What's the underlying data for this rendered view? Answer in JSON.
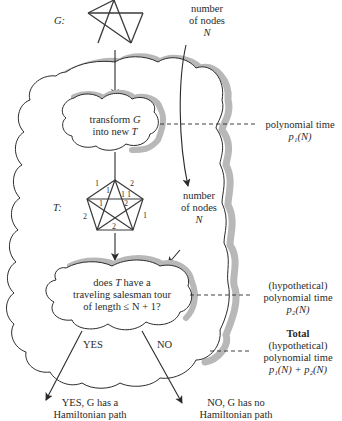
{
  "graph_g": {
    "label": "G:",
    "nodes_label_line1": "number",
    "nodes_label_line2": "of nodes",
    "nodes_label_var": "N"
  },
  "transform_step": {
    "line1_text": "transform ",
    "line1_var": "G",
    "line2_text": "into new ",
    "line2_var": "T"
  },
  "time1": {
    "line1": "polynomial time",
    "line2": "p₁(N)"
  },
  "graph_t": {
    "label": "T:",
    "nodes_label_line1": "number",
    "nodes_label_line2": "of nodes",
    "nodes_label_var": "N",
    "edge_weights": [
      "1",
      "2",
      "1",
      "1",
      "1",
      "1",
      "2",
      "2",
      "1",
      "2"
    ]
  },
  "decision_step": {
    "line1_pre": "does ",
    "line1_var": "T",
    "line1_post": " have a",
    "line2": "traveling salesman tour",
    "line3": "of length ≤ N + 1?"
  },
  "time2": {
    "line1": "(hypothetical)",
    "line2": "polynomial time",
    "line3": "p₂(N)"
  },
  "total_time": {
    "title": "Total",
    "line1": "(hypothetical)",
    "line2": "polynomial time",
    "line3": "p₁(N) + p₂(N)"
  },
  "branches": {
    "yes_label": "YES",
    "no_label": "NO",
    "yes_result_line1": "YES, G has a",
    "yes_result_line2": "Hamiltonian path",
    "no_result_line1": "NO, G has no",
    "no_result_line2": "Hamiltonian path"
  },
  "colors": {
    "stroke": "#2a2a2a",
    "shadow": "#b8b8b8",
    "background": "#ffffff"
  }
}
